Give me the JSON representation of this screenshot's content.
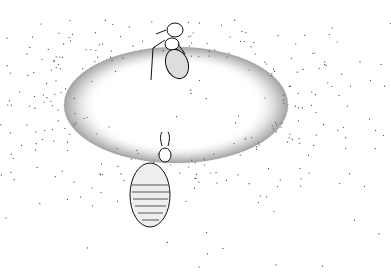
{
  "illustration": {
    "subject": "ant and antlion larva at sand pit",
    "style": "stippled pen-and-ink",
    "colors": {
      "ink": "#1a1a1a",
      "background": "#ffffff"
    },
    "elements": [
      {
        "name": "ant",
        "position": "top-center"
      },
      {
        "name": "sand-pit",
        "position": "center"
      },
      {
        "name": "antlion-larva",
        "position": "lower-center"
      }
    ]
  }
}
